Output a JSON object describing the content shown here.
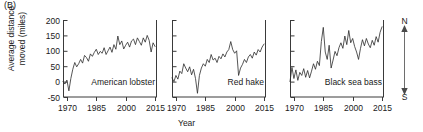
{
  "figure": {
    "panel_label": "(B)",
    "ylabel_line1": "Average distance",
    "ylabel_line2": "moved (miles)",
    "xlabel": "Year",
    "compass_north": "N",
    "compass_south": "S",
    "line_color": "#2b2b2b",
    "axis_color": "#3a3a3a",
    "text_color": "#1a1a1a",
    "background": "#ffffff"
  },
  "chart_data": {
    "type": "line",
    "title": "",
    "subtitle": "",
    "xlabel": "Year",
    "ylabel": "Average distance moved (miles)",
    "xlim": [
      1968,
      2016
    ],
    "ylim": [
      -50,
      200
    ],
    "xticks": [
      1970,
      1985,
      2000,
      2015
    ],
    "xticklabels": [
      "1970",
      "1985",
      "2000",
      "2015"
    ],
    "yticks": [
      -50,
      0,
      50,
      100,
      150,
      200
    ],
    "yticklabels": [
      "-50",
      "0",
      "50",
      "100",
      "150",
      "200"
    ],
    "grid": false,
    "legend": "none",
    "shared_y_axis": true,
    "y_labels_on_panel": 0,
    "annotations": [
      {
        "text": "N",
        "position": "right-top",
        "meaning": "north"
      },
      {
        "text": "S",
        "position": "right-bottom",
        "meaning": "south"
      }
    ],
    "panels": [
      {
        "name": "American lobster",
        "label": "American lobster",
        "x": [
          1968,
          1969,
          1970,
          1971,
          1972,
          1973,
          1974,
          1975,
          1976,
          1977,
          1978,
          1979,
          1980,
          1981,
          1982,
          1983,
          1984,
          1985,
          1986,
          1987,
          1988,
          1989,
          1990,
          1991,
          1992,
          1993,
          1994,
          1995,
          1996,
          1997,
          1998,
          1999,
          2000,
          2001,
          2002,
          2003,
          2004,
          2005,
          2006,
          2007,
          2008,
          2009,
          2010,
          2011,
          2012,
          2013,
          2014,
          2015
        ],
        "values": [
          0,
          -8,
          5,
          -30,
          10,
          40,
          62,
          48,
          58,
          72,
          60,
          85,
          78,
          66,
          90,
          82,
          95,
          105,
          88,
          98,
          92,
          110,
          88,
          100,
          112,
          95,
          120,
          105,
          148,
          120,
          132,
          106,
          118,
          128,
          112,
          132,
          138,
          120,
          142,
          130,
          118,
          142,
          128,
          150,
          134,
          96,
          126,
          114
        ]
      },
      {
        "name": "Red hake",
        "label": "Red hake",
        "x": [
          1968,
          1969,
          1970,
          1971,
          1972,
          1973,
          1974,
          1975,
          1976,
          1977,
          1978,
          1979,
          1980,
          1981,
          1982,
          1983,
          1984,
          1985,
          1986,
          1987,
          1988,
          1989,
          1990,
          1991,
          1992,
          1993,
          1994,
          1995,
          1996,
          1997,
          1998,
          1999,
          2000,
          2001,
          2002,
          2003,
          2004,
          2005,
          2006,
          2007,
          2008,
          2009,
          2010,
          2011,
          2012,
          2013,
          2014,
          2015
        ],
        "values": [
          12,
          0,
          20,
          8,
          34,
          26,
          58,
          44,
          32,
          48,
          22,
          40,
          10,
          -38,
          20,
          44,
          58,
          50,
          72,
          62,
          88,
          70,
          76,
          62,
          82,
          74,
          90,
          80,
          96,
          104,
          130,
          104,
          92,
          100,
          20,
          44,
          56,
          72,
          62,
          80,
          88,
          76,
          96,
          86,
          104,
          96,
          112,
          122
        ]
      },
      {
        "name": "Black sea bass",
        "label": "Black sea bass",
        "x": [
          1968,
          1969,
          1970,
          1971,
          1972,
          1973,
          1974,
          1975,
          1976,
          1977,
          1978,
          1979,
          1980,
          1981,
          1982,
          1983,
          1984,
          1985,
          1986,
          1987,
          1988,
          1989,
          1990,
          1991,
          1992,
          1993,
          1994,
          1995,
          1996,
          1997,
          1998,
          1999,
          2000,
          2001,
          2002,
          2003,
          2004,
          2005,
          2006,
          2007,
          2008,
          2009,
          2010,
          2011,
          2012,
          2013,
          2014,
          2015
        ],
        "values": [
          0,
          46,
          10,
          38,
          4,
          30,
          20,
          42,
          14,
          36,
          12,
          34,
          58,
          40,
          66,
          52,
          130,
          176,
          96,
          72,
          118,
          44,
          70,
          98,
          84,
          110,
          126,
          108,
          148,
          120,
          166,
          126,
          140,
          114,
          96,
          72,
          108,
          136,
          116,
          140,
          122,
          110,
          134,
          118,
          146,
          128,
          160,
          178
        ]
      }
    ]
  }
}
